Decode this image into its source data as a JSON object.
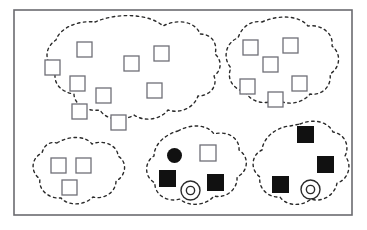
{
  "figure": {
    "background_color": "#ffffff",
    "frame": {
      "x": 14,
      "y": 10,
      "width": 338,
      "height": 205,
      "stroke_color": "#6b6b70",
      "stroke_width": 1.6,
      "fill": "#ffffff"
    },
    "styles": {
      "cluster_boundary_stroke": "#2a2a2a",
      "cluster_boundary_width": 1.4,
      "cluster_boundary_dash": "2.5 3.5",
      "open_square_stroke": "#6f6f77",
      "open_square_fill": "#ffffff",
      "open_square_stroke_width": 1.3,
      "filled_shape_fill": "#111111",
      "donut_stroke": "#2a2a2a",
      "donut_stroke_width": 1.4
    }
  },
  "chart_data": {
    "type": "scatter",
    "xlabel": "",
    "ylabel": "",
    "xlim": [
      14,
      352
    ],
    "ylim": [
      10,
      215
    ],
    "grid": false,
    "legend": "none",
    "shape_legend": {
      "open-square": "unlabeled / negative example",
      "filled-square": "labeled / positive example",
      "filled-circle": "labeled seed point",
      "donut-circle": "query / centroid point"
    },
    "cluster_count": 5,
    "total_points": 25,
    "clusters": [
      {
        "id": "cluster-top-left",
        "label": "Top-left cluster",
        "boundary_path": "M 95 22 C 118 12, 150 14, 163 26 C 178 18, 196 22, 200 34 C 212 34, 218 44, 215 54 C 222 60, 222 70, 214 76 C 218 86, 210 96, 198 96 C 194 108, 180 114, 168 110 C 160 120, 144 122, 134 115 C 122 122, 106 120, 100 110 C 86 112, 74 104, 74 94 C 60 92, 52 82, 56 70 C 44 62, 44 48, 56 40 C 60 28, 78 20, 95 22 Z",
        "point_count": 9,
        "points": [
          {
            "shape": "open-square",
            "x": 45,
            "y": 60,
            "size": 15
          },
          {
            "shape": "open-square",
            "x": 77,
            "y": 42,
            "size": 15
          },
          {
            "shape": "open-square",
            "x": 70,
            "y": 76,
            "size": 15
          },
          {
            "shape": "open-square",
            "x": 96,
            "y": 88,
            "size": 15
          },
          {
            "shape": "open-square",
            "x": 72,
            "y": 104,
            "size": 15
          },
          {
            "shape": "open-square",
            "x": 111,
            "y": 115,
            "size": 15
          },
          {
            "shape": "open-square",
            "x": 124,
            "y": 56,
            "size": 15
          },
          {
            "shape": "open-square",
            "x": 154,
            "y": 46,
            "size": 15
          },
          {
            "shape": "open-square",
            "x": 147,
            "y": 83,
            "size": 15
          }
        ]
      },
      {
        "id": "cluster-top-right",
        "label": "Top-right cluster",
        "boundary_path": "M 262 22 C 280 14, 300 16, 308 26 C 322 24, 334 34, 332 46 C 342 54, 340 68, 330 74 C 332 86, 322 96, 310 94 C 302 104, 286 106, 277 99 C 266 106, 250 102, 246 92 C 233 90, 226 78, 231 68 C 222 58, 226 42, 238 38 C 242 26, 252 20, 262 22 Z",
        "point_count": 6,
        "points": [
          {
            "shape": "open-square",
            "x": 243,
            "y": 40,
            "size": 15
          },
          {
            "shape": "open-square",
            "x": 283,
            "y": 38,
            "size": 15
          },
          {
            "shape": "open-square",
            "x": 263,
            "y": 57,
            "size": 15
          },
          {
            "shape": "open-square",
            "x": 240,
            "y": 79,
            "size": 15
          },
          {
            "shape": "open-square",
            "x": 292,
            "y": 76,
            "size": 15
          },
          {
            "shape": "open-square",
            "x": 268,
            "y": 92,
            "size": 15
          }
        ]
      },
      {
        "id": "cluster-bottom-left",
        "label": "Bottom-left cluster",
        "boundary_path": "M 57 143 C 70 135, 86 136, 92 144 C 104 139, 118 146, 118 156 C 128 162, 126 176, 116 181 C 116 192, 104 200, 93 197 C 84 206, 68 206, 61 198 C 48 199, 38 189, 40 179 C 30 172, 31 158, 42 153 C 44 145, 50 141, 57 143 Z",
        "point_count": 3,
        "points": [
          {
            "shape": "open-square",
            "x": 51,
            "y": 158,
            "size": 15
          },
          {
            "shape": "open-square",
            "x": 76,
            "y": 158,
            "size": 15
          },
          {
            "shape": "open-square",
            "x": 62,
            "y": 180,
            "size": 15
          }
        ]
      },
      {
        "id": "cluster-bottom-middle",
        "label": "Bottom-middle cluster",
        "boundary_path": "M 178 131 C 192 123, 208 125, 214 134 C 228 130, 240 139, 239 150 C 250 157, 248 172, 237 177 C 238 189, 226 199, 214 196 C 206 206, 188 207, 180 199 C 167 203, 154 194, 155 183 C 144 177, 144 162, 154 156 C 154 144, 166 134, 178 131 Z",
        "point_count": 5,
        "points": [
          {
            "shape": "filled-circle",
            "x": 167,
            "y": 148,
            "size": 15
          },
          {
            "shape": "open-square",
            "x": 200,
            "y": 145,
            "size": 16
          },
          {
            "shape": "filled-square",
            "x": 159,
            "y": 170,
            "size": 17
          },
          {
            "shape": "filled-square",
            "x": 207,
            "y": 174,
            "size": 17
          },
          {
            "shape": "donut-circle",
            "x": 181,
            "y": 181,
            "size": 19
          }
        ]
      },
      {
        "id": "cluster-bottom-right",
        "label": "Bottom-right cluster",
        "boundary_path": "M 300 124 C 314 118, 328 122, 333 132 C 345 134, 350 146, 345 156 C 353 165, 348 180, 337 183 C 335 195, 322 203, 311 199 C 302 207, 286 206, 280 197 C 268 198, 258 188, 260 177 C 250 170, 251 155, 262 150 C 263 138, 276 127, 290 126 Z",
        "point_count": 4,
        "points": [
          {
            "shape": "filled-square",
            "x": 297,
            "y": 126,
            "size": 17
          },
          {
            "shape": "filled-square",
            "x": 317,
            "y": 156,
            "size": 17
          },
          {
            "shape": "filled-square",
            "x": 272,
            "y": 176,
            "size": 17
          },
          {
            "shape": "donut-circle",
            "x": 301,
            "y": 180,
            "size": 19
          }
        ]
      }
    ]
  }
}
